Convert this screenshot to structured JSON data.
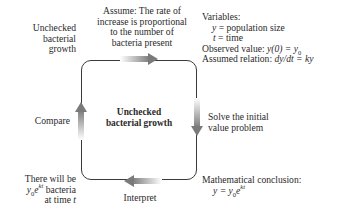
{
  "diagram": {
    "type": "cycle",
    "center_box": {
      "label_line1": "Unchecked",
      "label_line2": "bacterial growth"
    },
    "top_left_label": {
      "lines": [
        "Unchecked",
        "bacterial",
        "growth"
      ]
    },
    "top_arrow_label": {
      "lines": [
        "Assume: The rate of",
        "increase is proportional",
        "to the number of",
        "bacteria present"
      ]
    },
    "top_right_block": {
      "heading": "Variables:",
      "var_y": "y",
      "var_y_def": "= population size",
      "var_t": "t",
      "var_t_def": "= time",
      "observed_label": "Observed value: ",
      "observed_expr": "y(0) = y",
      "observed_sub": "0",
      "assumed_label": "Assumed relation: ",
      "assumed_expr": "dy/dt = ky"
    },
    "right_arrow_label": {
      "lines": [
        "Solve the initial",
        "value problem"
      ]
    },
    "bottom_right_block": {
      "heading": "Mathematical conclusion:",
      "eq_lhs": "y = y",
      "eq_sub": "0",
      "eq_base": "e",
      "eq_sup": "kt"
    },
    "bottom_arrow_label": "Interpret",
    "bottom_left_label": {
      "line1": "There will be",
      "line2_var": "y",
      "line2_sub": "0",
      "line2_base": "e",
      "line2_sup": "kt",
      "line2_rest": " bacteria",
      "line3_text": "at time ",
      "line3_var": "t"
    },
    "left_arrow_label": "Compare",
    "arrows": [
      {
        "id": "top",
        "direction": "right"
      },
      {
        "id": "right",
        "direction": "down"
      },
      {
        "id": "bottom",
        "direction": "left"
      },
      {
        "id": "left",
        "direction": "up"
      }
    ],
    "colors": {
      "text": "#2a2a2a",
      "box_border": "#3a3a3a",
      "arrow": "#8a8a8a",
      "background": "#ffffff"
    }
  }
}
